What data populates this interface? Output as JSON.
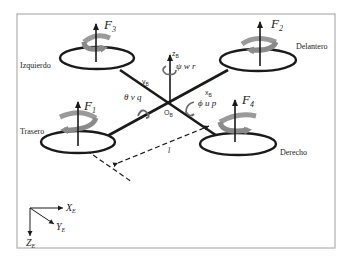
{
  "diagram": {
    "rotors": [
      {
        "id": "F1",
        "force_label": "F",
        "sub": "1",
        "position_label": "Trasero"
      },
      {
        "id": "F2",
        "force_label": "F",
        "sub": "2",
        "position_label": "Delantero"
      },
      {
        "id": "F3",
        "force_label": "F",
        "sub": "3",
        "position_label": "Izquierdo"
      },
      {
        "id": "F4",
        "force_label": "F",
        "sub": "4",
        "position_label": "Derecho"
      }
    ],
    "body_frame": {
      "origin": "O",
      "origin_sub": "B",
      "x_axis": "x",
      "x_sub": "B",
      "y_axis": "y",
      "y_sub": "B",
      "z_axis": "z",
      "z_sub": "B"
    },
    "rotations": {
      "roll": "ϕ u p",
      "pitch": "θ v q",
      "yaw": "ψ w r"
    },
    "arm_length_label": "l",
    "earth_frame": {
      "x": "X",
      "x_sub": "E",
      "y": "Y",
      "y_sub": "E",
      "z": "Z",
      "z_sub": "E"
    },
    "colors": {
      "line": "#1a1a1a",
      "rotation_arrow": "#8a8a8a",
      "rotation_arrow_dark": "#5a5a5a",
      "frame_border": "#b0b0b0"
    }
  }
}
